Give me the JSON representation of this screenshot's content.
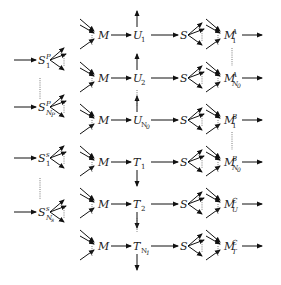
{
  "diagram": {
    "left_sources": [
      {
        "base": "S",
        "sup": "P",
        "sub": "1",
        "y": 60
      },
      {
        "base": "S",
        "sup": "P",
        "sub": "N",
        "subsub": "P",
        "y": 107
      },
      {
        "base": "S",
        "sup": "s",
        "sub": "1",
        "y": 158
      },
      {
        "base": "S",
        "sup": "s",
        "sub": "N",
        "subsub": "s",
        "y": 212
      }
    ],
    "middle_rows": [
      {
        "m": "M",
        "node": "U",
        "node_sub": "1",
        "s": "S",
        "arrow": "up",
        "y": 35
      },
      {
        "m": "M",
        "node": "U",
        "node_sub": "2",
        "s": "S",
        "arrow": "up",
        "y": 78
      },
      {
        "m": "M",
        "node": "U",
        "node_sub": "N",
        "node_subsub": "0",
        "s": "S",
        "arrow": "up",
        "y": 120
      },
      {
        "m": "M",
        "node": "T",
        "node_sub": "1",
        "s": "S",
        "arrow": "down",
        "y": 162
      },
      {
        "m": "M",
        "node": "T",
        "node_sub": "2",
        "s": "S",
        "arrow": "down",
        "y": 204
      },
      {
        "m": "M",
        "node": "T",
        "node_sub": "N",
        "node_subsub": "1",
        "s": "S",
        "arrow": "down",
        "y": 246
      }
    ],
    "right_markets": [
      {
        "base": "M",
        "sup": "A",
        "sub": "1",
        "y": 35
      },
      {
        "base": "M",
        "sup": "A",
        "sub": "N",
        "subsub": "0",
        "y": 78
      },
      {
        "base": "M",
        "sup": "B",
        "sub": "1",
        "y": 120
      },
      {
        "base": "M",
        "sup": "B",
        "sub": "N",
        "subsub": "0",
        "y": 162
      },
      {
        "base": "M",
        "sup": "C",
        "sub": "U",
        "y": 204
      },
      {
        "base": "M",
        "sup": "C",
        "sub": "T",
        "y": 246
      }
    ],
    "colors": {
      "ink": "#111111",
      "dots": "#555555",
      "background": "#ffffff"
    }
  }
}
